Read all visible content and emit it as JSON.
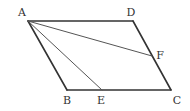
{
  "figure": {
    "type": "parallelogram",
    "points": {
      "A": {
        "label": "A",
        "x": 28,
        "y": 21,
        "lx": 22,
        "ly": 16
      },
      "B": {
        "label": "B",
        "x": 67,
        "y": 90,
        "lx": 67,
        "ly": 104
      },
      "C": {
        "label": "C",
        "x": 171,
        "y": 90,
        "lx": 177,
        "ly": 104
      },
      "D": {
        "label": "D",
        "x": 133,
        "y": 21,
        "lx": 131,
        "ly": 16
      },
      "E": {
        "label": "E",
        "x": 102,
        "y": 90,
        "lx": 101,
        "ly": 104
      },
      "F": {
        "label": "F",
        "x": 152,
        "y": 56,
        "lx": 160,
        "ly": 59
      }
    },
    "edges": [
      [
        "A",
        "D"
      ],
      [
        "D",
        "C"
      ],
      [
        "C",
        "B"
      ],
      [
        "B",
        "A"
      ]
    ],
    "segments": [
      [
        "A",
        "E"
      ],
      [
        "A",
        "F"
      ]
    ],
    "stroke_color": "#333333"
  }
}
